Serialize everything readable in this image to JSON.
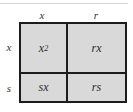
{
  "diagram": {
    "type": "area-model-multiplication-grid",
    "column_headers": [
      "x",
      "r"
    ],
    "row_headers": [
      "x",
      "s"
    ],
    "cells": [
      [
        {
          "base": "x",
          "exponent": "2"
        },
        {
          "text": "rx"
        }
      ],
      [
        {
          "text": "sx"
        },
        {
          "text": "rs"
        }
      ]
    ],
    "colors": {
      "cell_fill": "#d9d9d9",
      "border": "#1c1c1c",
      "text": "#2a2a2a",
      "top_rule": "#d4d4d4"
    }
  }
}
